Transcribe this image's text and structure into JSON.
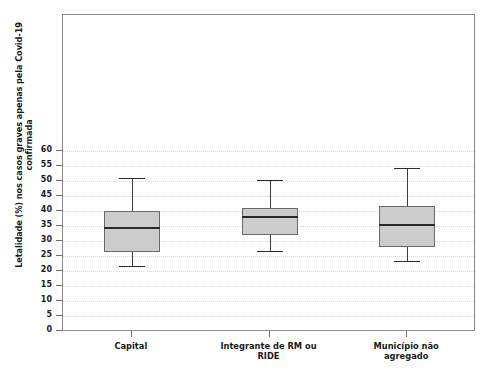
{
  "chart_data": {
    "type": "box",
    "title": "",
    "xlabel": "",
    "ylabel": "Letalidade (%) nos casos graves apenas pela Covid-19 confirmada",
    "ylabel_line1": "Letalidade (%) nos casos graves apenas pela Covid-19",
    "ylabel_line2": "confirmada",
    "ylim": [
      0,
      62
    ],
    "yticks": [
      0,
      5,
      10,
      15,
      20,
      25,
      30,
      35,
      40,
      45,
      50,
      55,
      60
    ],
    "ytick_labels": [
      "0",
      "5",
      "10",
      "15",
      "20",
      "25",
      "30",
      "35",
      "40",
      "45",
      "50",
      "55",
      "60"
    ],
    "grid": "horizontal-dotted",
    "legend": "none",
    "categories": [
      "Capital",
      "Integrante de RM ou RIDE",
      "Município não agregado"
    ],
    "category_lines": [
      [
        "Capital"
      ],
      [
        "Integrante de RM ou",
        "RIDE"
      ],
      [
        "Município não",
        "agregado"
      ]
    ],
    "boxes": [
      {
        "category": "Capital",
        "whisker_low": 21.6,
        "q1": 26.4,
        "median": 34.8,
        "q3": 40.0,
        "whisker_high": 51.0
      },
      {
        "category": "Integrante de RM ou RIDE",
        "whisker_low": 26.8,
        "q1": 32.0,
        "median": 38.2,
        "q3": 41.0,
        "whisker_high": 50.3
      },
      {
        "category": "Município não agregado",
        "whisker_low": 23.3,
        "q1": 28.0,
        "median": 35.8,
        "q3": 41.7,
        "whisker_high": 54.5
      }
    ],
    "colors": {
      "box_fill": "#cccccc",
      "box_border": "#6a6a6a",
      "median": "#2b2b2b",
      "whisker": "#3c3c3c",
      "grid": "#d8d8d8",
      "frame": "#8a8a8a",
      "text": "#1a1a1a"
    }
  },
  "caption": {
    "text": ""
  }
}
